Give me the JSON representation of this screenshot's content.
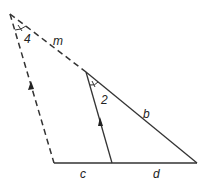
{
  "diagram": {
    "labels": {
      "angle_top": "4",
      "angle_mid": "2",
      "side_m": "m",
      "side_b": "b",
      "side_c": "c",
      "side_d": "d"
    },
    "line_color": "#333333"
  }
}
